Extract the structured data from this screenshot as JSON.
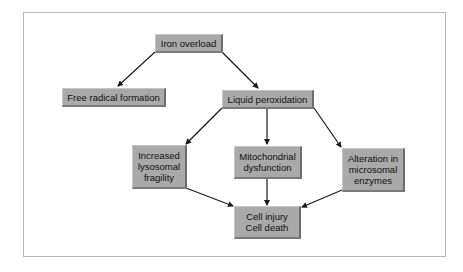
{
  "diagram": {
    "type": "flowchart",
    "nodes": {
      "iron_overload": "Iron overload",
      "free_radical": "Free radical formation",
      "liquid_peroxidation": "Liquid peroxidation",
      "lysosomal": "Increased\nlysosomal\nfragility",
      "mitochondrial": "Mitochondrial\ndysfunction",
      "microsomal": "Alteration in\nmicrosomal\nenzymes",
      "cell_injury": "Cell injury\nCell death"
    },
    "edges": [
      [
        "Iron overload",
        "Free radical formation"
      ],
      [
        "Iron overload",
        "Liquid peroxidation"
      ],
      [
        "Liquid peroxidation",
        "Increased lysosomal fragility"
      ],
      [
        "Liquid peroxidation",
        "Mitochondrial dysfunction"
      ],
      [
        "Liquid peroxidation",
        "Alteration in microsomal enzymes"
      ],
      [
        "Increased lysosomal fragility",
        "Cell injury Cell death"
      ],
      [
        "Mitochondrial dysfunction",
        "Cell injury Cell death"
      ],
      [
        "Alteration in microsomal enzymes",
        "Cell injury Cell death"
      ]
    ],
    "colors": {
      "node_fill": "#a9a9a9",
      "node_shadow": "#6d6d6d",
      "arrow": "#1a1a1a",
      "frame_border": "#b8b8b8"
    }
  }
}
